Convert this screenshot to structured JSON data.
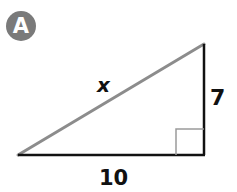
{
  "badge": {
    "label": "A",
    "color": "#7a7a7a"
  },
  "triangle": {
    "type": "right-triangle",
    "hypotenuse_label": "x",
    "vertical_leg_label": "7",
    "base_leg_label": "10",
    "hypotenuse_color": "#8c8c8c",
    "leg_color": "#111111",
    "right_angle_marker_color": "#9a9a9a"
  }
}
